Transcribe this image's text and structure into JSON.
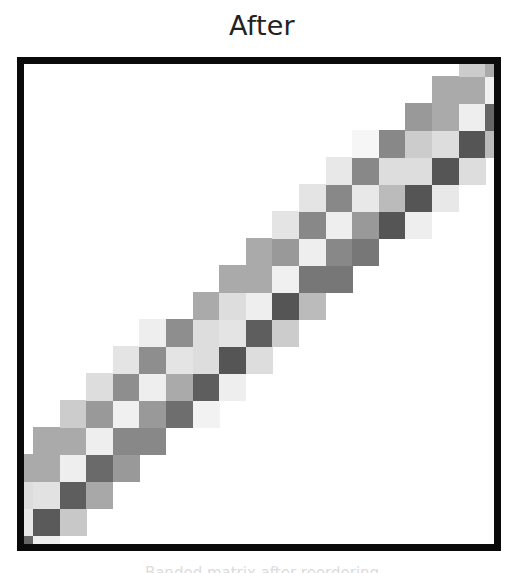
{
  "title": "After",
  "caption": "Banded matrix after reordering",
  "colors": {
    "frame": "#0a0a0a",
    "background": "#ffffff"
  },
  "grid_geometry": {
    "inner_width": 470,
    "inner_height": 480,
    "first_col_width": 9,
    "col_width": 26.6,
    "last_row_height": 9,
    "row_height": 27,
    "top_row_height": 12,
    "num_cols": 19,
    "num_rows": 19
  },
  "chart_data": {
    "type": "heatmap",
    "title": "After",
    "rows_from_bottom": [
      [
        [
          0,
          "#666666"
        ],
        [
          1,
          "#eeeeee"
        ]
      ],
      [
        [
          0,
          "#e8e8e8"
        ],
        [
          1,
          "#5a5a5a"
        ],
        [
          2,
          "#c8c8c8"
        ]
      ],
      [
        [
          0,
          "#dddddd"
        ],
        [
          1,
          "#e2e2e2"
        ],
        [
          2,
          "#5e5e5e"
        ],
        [
          3,
          "#a8a8a8"
        ]
      ],
      [
        [
          0,
          "#aaaaaa"
        ],
        [
          1,
          "#aaaaaa"
        ],
        [
          2,
          "#eeeeee"
        ],
        [
          3,
          "#6a6a6a"
        ],
        [
          4,
          "#999999"
        ]
      ],
      [
        [
          1,
          "#aaaaaa"
        ],
        [
          2,
          "#aaaaaa"
        ],
        [
          3,
          "#eeeeee"
        ],
        [
          4,
          "#888888"
        ],
        [
          5,
          "#888888"
        ]
      ],
      [
        [
          2,
          "#cccccc"
        ],
        [
          3,
          "#999999"
        ],
        [
          4,
          "#f0f0f0"
        ],
        [
          5,
          "#999999"
        ],
        [
          6,
          "#6e6e6e"
        ],
        [
          7,
          "#f2f2f2"
        ]
      ],
      [
        [
          3,
          "#dddddd"
        ],
        [
          4,
          "#8e8e8e"
        ],
        [
          5,
          "#eeeeee"
        ],
        [
          6,
          "#aaaaaa"
        ],
        [
          7,
          "#5e5e5e"
        ],
        [
          8,
          "#eeeeee"
        ]
      ],
      [
        [
          4,
          "#e4e4e4"
        ],
        [
          5,
          "#8e8e8e"
        ],
        [
          6,
          "#e4e4e4"
        ],
        [
          7,
          "#dddddd"
        ],
        [
          8,
          "#555555"
        ],
        [
          9,
          "#dddddd"
        ]
      ],
      [
        [
          5,
          "#eeeeee"
        ],
        [
          6,
          "#8e8e8e"
        ],
        [
          7,
          "#dddddd"
        ],
        [
          8,
          "#e4e4e4"
        ],
        [
          9,
          "#5e5e5e"
        ],
        [
          10,
          "#cccccc"
        ]
      ],
      [
        [
          7,
          "#aaaaaa"
        ],
        [
          8,
          "#dddddd"
        ],
        [
          9,
          "#eeeeee"
        ],
        [
          10,
          "#555555"
        ],
        [
          11,
          "#bbbbbb"
        ]
      ],
      [
        [
          8,
          "#aaaaaa"
        ],
        [
          9,
          "#aaaaaa"
        ],
        [
          10,
          "#f0f0f0"
        ],
        [
          11,
          "#777777"
        ],
        [
          12,
          "#777777"
        ]
      ],
      [
        [
          9,
          "#aaaaaa"
        ],
        [
          10,
          "#999999"
        ],
        [
          11,
          "#eeeeee"
        ],
        [
          12,
          "#888888"
        ],
        [
          13,
          "#777777"
        ]
      ],
      [
        [
          10,
          "#e4e4e4"
        ],
        [
          11,
          "#888888"
        ],
        [
          12,
          "#eeeeee"
        ],
        [
          13,
          "#999999"
        ],
        [
          14,
          "#555555"
        ],
        [
          15,
          "#eeeeee"
        ]
      ],
      [
        [
          11,
          "#e4e4e4"
        ],
        [
          12,
          "#888888"
        ],
        [
          13,
          "#e8e8e8"
        ],
        [
          14,
          "#bbbbbb"
        ],
        [
          15,
          "#555555"
        ],
        [
          16,
          "#e8e8e8"
        ]
      ],
      [
        [
          12,
          "#e8e8e8"
        ],
        [
          13,
          "#888888"
        ],
        [
          14,
          "#dddddd"
        ],
        [
          15,
          "#dddddd"
        ],
        [
          16,
          "#555555"
        ],
        [
          17,
          "#dddddd"
        ]
      ],
      [
        [
          13,
          "#f6f6f6"
        ],
        [
          14,
          "#888888"
        ],
        [
          15,
          "#cccccc"
        ],
        [
          16,
          "#dddddd"
        ],
        [
          17,
          "#555555"
        ],
        [
          18,
          "#bbbbbb"
        ]
      ],
      [
        [
          15,
          "#999999"
        ],
        [
          16,
          "#aaaaaa"
        ],
        [
          17,
          "#eeeeee"
        ],
        [
          18,
          "#666666"
        ]
      ],
      [
        [
          16,
          "#aaaaaa"
        ],
        [
          17,
          "#aaaaaa"
        ],
        [
          18,
          "#f0f0f0"
        ]
      ],
      [
        [
          17,
          "#cccccc"
        ],
        [
          18,
          "#aaaaaa"
        ]
      ]
    ]
  }
}
